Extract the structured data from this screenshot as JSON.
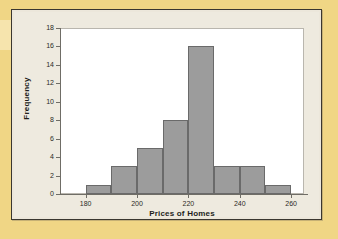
{
  "figure": {
    "background_color": "#eeeadf",
    "page_margin_color": "#f0d685",
    "frame_color": "#3a3730",
    "plot_background": "#ffffff"
  },
  "chart_data": {
    "type": "bar",
    "title": "",
    "subtitle": "",
    "xlabel": "Prices of Homes",
    "ylabel": "Frequency",
    "categories": [
      "180-190",
      "190-200",
      "200-210",
      "210-220",
      "220-230",
      "230-240",
      "240-250",
      "250-260"
    ],
    "bin_edges": [
      180,
      190,
      200,
      210,
      220,
      230,
      240,
      250,
      260
    ],
    "bin_width": 10,
    "values": [
      1,
      3,
      5,
      8,
      16,
      3,
      3,
      1
    ],
    "x": [
      185,
      195,
      205,
      215,
      225,
      235,
      245,
      255
    ],
    "xlim": [
      170,
      265
    ],
    "ylim": [
      0,
      18
    ],
    "xticks": [
      180,
      200,
      220,
      240,
      260
    ],
    "xtick_labels": [
      "180",
      "200",
      "220",
      "240",
      "260"
    ],
    "yticks": [
      0,
      2,
      4,
      6,
      8,
      10,
      12,
      14,
      16,
      18
    ],
    "ytick_labels": [
      "0",
      "2",
      "4",
      "6",
      "8",
      "10",
      "12",
      "14",
      "16",
      "18"
    ],
    "grid": false,
    "legend": null,
    "legend_position": "none",
    "bar_fill_color": "#9c9c9c",
    "bar_edge_color": "#6a6a6a",
    "total_count": 40,
    "annotations": []
  }
}
